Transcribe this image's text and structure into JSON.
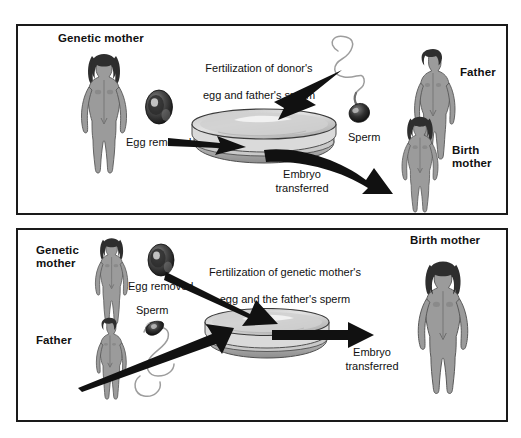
{
  "figure": {
    "top_fragment": "",
    "panels": [
      {
        "id": "donor-egg-surrogacy",
        "labels": {
          "genetic_mother": "Genetic mother",
          "egg_removed": "Egg removed",
          "fertilization_line1": "Fertilization of donor's",
          "fertilization_line2": "egg and father's sperm",
          "fertilization_italic": "in vitro.",
          "sperm": "Sperm",
          "father": "Father",
          "embryo_transferred": "Embryo\ntransferred",
          "birth_mother": "Birth\nmother"
        }
      },
      {
        "id": "gestational-surrogacy",
        "labels": {
          "genetic_mother": "Genetic\nmother",
          "egg_removed": "Egg removed",
          "father": "Father",
          "sperm": "Sperm",
          "fertilization_line1": "Fertilization of genetic mother's",
          "fertilization_line2": "egg and the father's sperm",
          "fertilization_italic": "in vitro.",
          "embryo_transferred": "Embryo\ntransferred",
          "birth_mother": "Birth mother"
        }
      }
    ],
    "icons": {
      "female_figure": "female-body-icon",
      "male_figure": "male-body-icon",
      "ovum": "ovum-egg-icon",
      "sperm": "sperm-cell-icon",
      "petri_dish": "petri-dish-icon",
      "arrow": "arrow-icon"
    },
    "colors": {
      "border": "#1a1a1a",
      "background": "#ffffff",
      "body_fill": "#9a9a9a",
      "body_shade": "#7d7d7d",
      "hair": "#2e2e2e",
      "arrow": "#111111",
      "dish_top": "#d4d4d4",
      "dish_wall": "#b0b0b0",
      "text": "#111111"
    }
  }
}
